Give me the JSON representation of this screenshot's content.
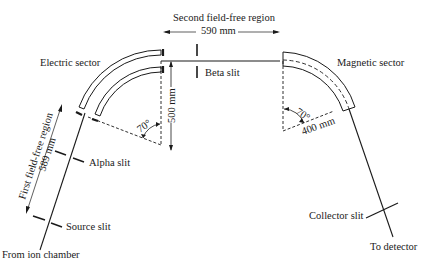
{
  "diagram": {
    "type": "mass-spectrometer-schematic",
    "labels": {
      "electric_sector": "Electric sector",
      "magnetic_sector": "Magnetic sector",
      "second_region": "Second field-free region",
      "second_region_length": "590 mm",
      "beta_slit": "Beta slit",
      "electric_radius": "500 mm",
      "electric_angle": "70°",
      "magnetic_angle": "70°",
      "magnetic_radius": "400 mm",
      "first_region": "First field-free region",
      "first_region_length": "589 mm",
      "alpha_slit": "Alpha slit",
      "source_slit": "Source slit",
      "from_ion_chamber": "From ion chamber",
      "collector_slit": "Collector slit",
      "to_detector": "To detector"
    },
    "colors": {
      "ink": "#1a1a1a",
      "background": "#ffffff"
    }
  }
}
